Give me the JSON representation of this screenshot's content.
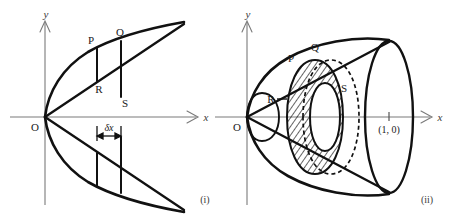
{
  "figure": {
    "background_color": "#ffffff",
    "ink_color": "#111111",
    "axis_color": "#7a7a7a",
    "panels": [
      {
        "id": "panel-i",
        "caption": "(i)",
        "description": "Region bounded by a parabola and its chord, with an elemental vertical strip PQSR of width delta-x",
        "axes": {
          "x_label": "x",
          "y_label": "y",
          "origin_label": "O"
        },
        "point_labels": [
          {
            "name": "P",
            "text": "P"
          },
          {
            "name": "Q",
            "text": "Q"
          },
          {
            "name": "R",
            "text": "R"
          },
          {
            "name": "S",
            "text": "S"
          }
        ],
        "dimension_label": "δx"
      },
      {
        "id": "panel-ii",
        "caption": "(ii)",
        "description": "Solid of revolution (cone-like) generated by rotating the region about the x-axis, showing the hatched elemental annular disc PQSR",
        "axes": {
          "x_label": "x",
          "y_label": "y",
          "origin_label": "O"
        },
        "point_labels": [
          {
            "name": "P",
            "text": "P"
          },
          {
            "name": "Q",
            "text": "Q"
          },
          {
            "name": "R",
            "text": "R"
          },
          {
            "name": "S",
            "text": "S"
          }
        ],
        "marked_point": "(1, 0)"
      }
    ]
  }
}
